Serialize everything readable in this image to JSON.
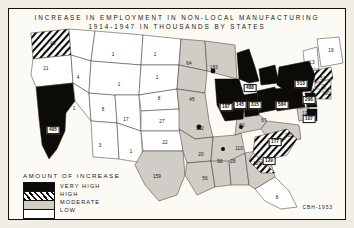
{
  "title": {
    "line1": "INCREASE IN EMPLOYMENT IN  NON-LOCAL MANUFACTURING",
    "line2": "1914-1947  IN  THOUSANDS   BY  STATES"
  },
  "legend": {
    "heading": "AMOUNT OF INCREASE",
    "items": [
      {
        "label": "VERY HIGH",
        "swatch": "solid-black",
        "color": "#0d0b08"
      },
      {
        "label": "HIGH",
        "swatch": "diagonal-hatch",
        "color": "#0d0b08"
      },
      {
        "label": "MODERATE",
        "swatch": "light-gray",
        "color": "#cfcdc6"
      },
      {
        "label": "LOW",
        "swatch": "white",
        "color": "#ffffff"
      }
    ]
  },
  "credit": "CBH-1953",
  "chart_data": {
    "type": "map",
    "title": "INCREASE IN EMPLOYMENT IN NON-LOCAL MANUFACTURING 1914-1947 IN THOUSANDS BY STATES",
    "units": "thousands of employees",
    "classes": [
      "VERY HIGH",
      "HIGH",
      "MODERATE",
      "LOW"
    ],
    "states": [
      {
        "name": "Washington",
        "value": 45,
        "class": "HIGH",
        "x": 44,
        "y": 34
      },
      {
        "name": "Oregon",
        "value": 21,
        "class": "LOW",
        "x": 37,
        "y": 59
      },
      {
        "name": "California",
        "value": 405,
        "class": "VERY HIGH",
        "x": 44,
        "y": 121
      },
      {
        "name": "Idaho",
        "value": 4,
        "class": "LOW",
        "x": 69,
        "y": 68
      },
      {
        "name": "Nevada",
        "value": 1,
        "class": "LOW",
        "x": 65,
        "y": 99
      },
      {
        "name": "Utah",
        "value": 8,
        "class": "LOW",
        "x": 94,
        "y": 100
      },
      {
        "name": "Arizona",
        "value": 3,
        "class": "LOW",
        "x": 91,
        "y": 136
      },
      {
        "name": "Montana",
        "value": 1,
        "class": "LOW",
        "x": 104,
        "y": 45
      },
      {
        "name": "Wyoming",
        "value": 1,
        "class": "LOW",
        "x": 110,
        "y": 75
      },
      {
        "name": "Colorado",
        "value": 17,
        "class": "LOW",
        "x": 117,
        "y": 110
      },
      {
        "name": "New Mexico",
        "value": 1,
        "class": "LOW",
        "x": 122,
        "y": 142
      },
      {
        "name": "North Dakota",
        "value": 1,
        "class": "LOW",
        "x": 146,
        "y": 45
      },
      {
        "name": "South Dakota",
        "value": 1,
        "class": "LOW",
        "x": 148,
        "y": 68
      },
      {
        "name": "Nebraska",
        "value": 8,
        "class": "LOW",
        "x": 150,
        "y": 89
      },
      {
        "name": "Kansas",
        "value": 27,
        "class": "LOW",
        "x": 153,
        "y": 112
      },
      {
        "name": "Oklahoma",
        "value": 22,
        "class": "LOW",
        "x": 156,
        "y": 133
      },
      {
        "name": "Texas",
        "value": 159,
        "class": "MODERATE",
        "x": 148,
        "y": 167
      },
      {
        "name": "Minnesota",
        "value": 64,
        "class": "MODERATE",
        "x": 180,
        "y": 54
      },
      {
        "name": "Iowa",
        "value": 45,
        "class": "MODERATE",
        "x": 183,
        "y": 90
      },
      {
        "name": "Missouri",
        "value": 132,
        "class": "MODERATE",
        "x": 191,
        "y": 119
      },
      {
        "name": "Arkansas",
        "value": 20,
        "class": "MODERATE",
        "x": 192,
        "y": 145
      },
      {
        "name": "Louisiana",
        "value": 56,
        "class": "MODERATE",
        "x": 196,
        "y": 169
      },
      {
        "name": "Wisconsin",
        "value": 183,
        "class": "MODERATE",
        "x": 205,
        "y": 58
      },
      {
        "name": "Illinois",
        "value": 187,
        "class": "VERY HIGH",
        "x": 217,
        "y": 98
      },
      {
        "name": "Michigan",
        "value": 488,
        "class": "VERY HIGH",
        "x": 241,
        "y": 79
      },
      {
        "name": "Indiana",
        "value": 145,
        "class": "VERY HIGH",
        "x": 231,
        "y": 96
      },
      {
        "name": "Ohio",
        "value": 315,
        "class": "VERY HIGH",
        "x": 246,
        "y": 96
      },
      {
        "name": "Kentucky",
        "value": 60,
        "class": "MODERATE",
        "x": 233,
        "y": 116
      },
      {
        "name": "Tennessee",
        "value": 110,
        "class": "MODERATE",
        "x": 230,
        "y": 139
      },
      {
        "name": "Mississippi",
        "value": 56,
        "class": "MODERATE",
        "x": 211,
        "y": 152
      },
      {
        "name": "Alabama",
        "value": 28,
        "class": "MODERATE",
        "x": 224,
        "y": 152
      },
      {
        "name": "Georgia",
        "value": 129,
        "class": "MODERATE",
        "x": 248,
        "y": 154
      },
      {
        "name": "Florida",
        "value": 8,
        "class": "LOW",
        "x": 268,
        "y": 188
      },
      {
        "name": "South Carolina",
        "value": 129,
        "class": "HIGH",
        "x": 260,
        "y": 152
      },
      {
        "name": "North Carolina",
        "value": 177,
        "class": "HIGH",
        "x": 266,
        "y": 133
      },
      {
        "name": "Virginia",
        "value": 105,
        "class": "MODERATE",
        "x": 280,
        "y": 126
      },
      {
        "name": "West Virginia",
        "value": 67,
        "class": "MODERATE",
        "x": 255,
        "y": 111
      },
      {
        "name": "Pennsylvania",
        "value": 584,
        "class": "VERY HIGH",
        "x": 273,
        "y": 96
      },
      {
        "name": "New York",
        "value": 513,
        "class": "VERY HIGH",
        "x": 292,
        "y": 75
      },
      {
        "name": "New Jersey",
        "value": 296,
        "class": "VERY HIGH",
        "x": 300,
        "y": 91
      },
      {
        "name": "Maryland",
        "value": 12,
        "class": "MODERATE",
        "x": 296,
        "y": 104
      },
      {
        "name": "Delaware",
        "value": 107,
        "class": "MODERATE",
        "x": 300,
        "y": 110
      },
      {
        "name": "Connecticut",
        "value": 150,
        "class": "HIGH",
        "x": 317,
        "y": 84
      },
      {
        "name": "Rhode Island",
        "value": 27,
        "class": "HIGH",
        "x": 315,
        "y": 77
      },
      {
        "name": "Massachusetts",
        "value": 54,
        "class": "HIGH",
        "x": 314,
        "y": 69
      },
      {
        "name": "Vermont",
        "value": 13,
        "class": "LOW",
        "x": 303,
        "y": 53
      },
      {
        "name": "Maine",
        "value": 19,
        "class": "LOW",
        "x": 322,
        "y": 41
      }
    ]
  }
}
